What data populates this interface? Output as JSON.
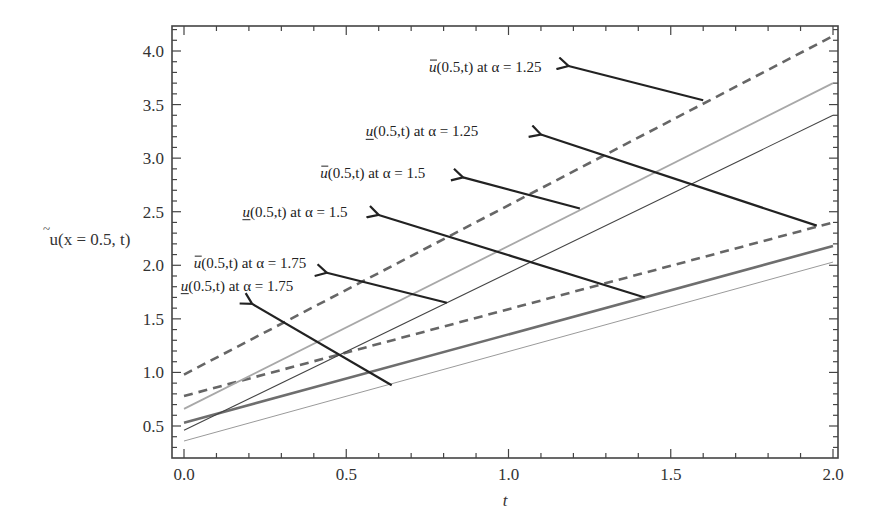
{
  "chart_data": {
    "type": "line",
    "title": "",
    "xlabel": "t",
    "ylabel": "ũ(x = 0.5, t)",
    "xlim": [
      0.0,
      2.0
    ],
    "ylim": [
      0.27,
      4.22
    ],
    "grid": false,
    "legend_position": "none (inline annotations with arrows)",
    "x_ticks": [
      "0.0",
      "0.5",
      "1.0",
      "1.5",
      "2.0"
    ],
    "y_ticks": [
      "0.5",
      "1.0",
      "1.5",
      "2.0",
      "2.5",
      "3.0",
      "3.5",
      "4.0"
    ],
    "series": [
      {
        "name": "ū(0.5,t) at α=1.25",
        "style": "dashed",
        "color": "#666666",
        "x": [
          0,
          2
        ],
        "values": [
          0.98,
          4.14
        ]
      },
      {
        "name": "u̲(0.5,t) at α=1.25",
        "style": "dashed",
        "color": "#666666",
        "x": [
          0,
          2
        ],
        "values": [
          0.78,
          2.4
        ]
      },
      {
        "name": "ū(0.5,t) at α=1.5",
        "style": "solid-light",
        "color": "#a8a8a8",
        "x": [
          0,
          2
        ],
        "values": [
          0.66,
          3.7
        ]
      },
      {
        "name": "u̲(0.5,t) at α=1.5",
        "style": "solid-thick",
        "color": "#6e6e6e",
        "x": [
          0,
          2
        ],
        "values": [
          0.53,
          2.18
        ]
      },
      {
        "name": "ū(0.5,t) at α=1.75",
        "style": "solid-thin-dark",
        "color": "#444444",
        "x": [
          0,
          2
        ],
        "values": [
          0.46,
          3.4
        ]
      },
      {
        "name": "u̲(0.5,t) at α=1.75",
        "style": "solid-thin-light",
        "color": "#9a9a9a",
        "x": [
          0,
          2
        ],
        "values": [
          0.36,
          2.03
        ]
      }
    ],
    "annotations": [
      {
        "label_prefix": "u",
        "bar": "over",
        "label_rest": "(0.5,t) at α = 1.25",
        "text_x": 0.755,
        "text_y": 3.85,
        "arrow_from": [
          1.6,
          3.54
        ],
        "arrow_to": [
          1.185,
          3.86
        ]
      },
      {
        "label_prefix": "u",
        "bar": "under",
        "label_rest": "(0.5,t) at α = 1.25",
        "text_x": 0.56,
        "text_y": 3.25,
        "arrow_from": [
          1.95,
          2.37
        ],
        "arrow_to": [
          1.1,
          3.22
        ]
      },
      {
        "label_prefix": "u",
        "bar": "over",
        "label_rest": "(0.5,t) at α = 1.5",
        "text_x": 0.42,
        "text_y": 2.86,
        "arrow_from": [
          1.22,
          2.53
        ],
        "arrow_to": [
          0.86,
          2.82
        ]
      },
      {
        "label_prefix": "u",
        "bar": "under",
        "label_rest": "(0.5,t) at α = 1.5",
        "text_x": 0.18,
        "text_y": 2.5,
        "arrow_from": [
          1.42,
          1.7
        ],
        "arrow_to": [
          0.6,
          2.47
        ]
      },
      {
        "label_prefix": "u",
        "bar": "over",
        "label_rest": "(0.5,t) at α = 1.75",
        "text_x": 0.03,
        "text_y": 2.02,
        "arrow_from": [
          0.81,
          1.65
        ],
        "arrow_to": [
          0.44,
          1.93
        ]
      },
      {
        "label_prefix": "u",
        "bar": "under",
        "label_rest": "(0.5,t) at α = 1.75",
        "text_x": -0.01,
        "text_y": 1.81,
        "arrow_from": [
          0.64,
          0.88
        ],
        "arrow_to": [
          0.21,
          1.64
        ]
      }
    ]
  }
}
